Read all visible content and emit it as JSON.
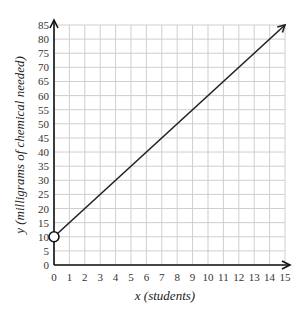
{
  "chart_data": {
    "type": "line",
    "title": "",
    "xlabel": "x (students)",
    "ylabel": "y (milligrams of chemical needed)",
    "xlim": [
      0,
      15
    ],
    "ylim": [
      0,
      85
    ],
    "x_ticks": [
      0,
      1,
      2,
      3,
      4,
      5,
      6,
      7,
      8,
      9,
      10,
      11,
      12,
      13,
      14,
      15
    ],
    "y_ticks": [
      0,
      5,
      10,
      15,
      20,
      25,
      30,
      35,
      40,
      45,
      50,
      55,
      60,
      65,
      70,
      75,
      80,
      85
    ],
    "grid": true,
    "series": [
      {
        "name": "line",
        "x": [
          0,
          15
        ],
        "y": [
          10,
          85
        ],
        "start_marker": "open-circle",
        "end_marker": "arrow"
      }
    ],
    "equation": "y = 5x + 10"
  },
  "colors": {
    "grid": "#cfcfcf",
    "axis": "#111111",
    "line": "#222222"
  }
}
